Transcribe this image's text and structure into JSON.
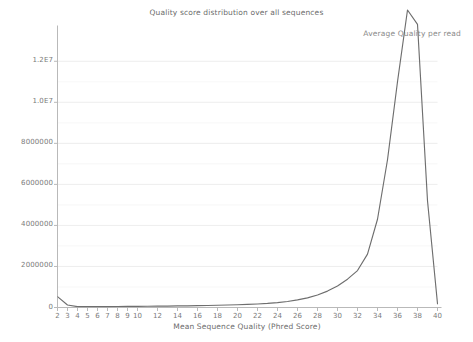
{
  "chart_data": {
    "type": "line",
    "title": "Quality score distribution over all sequences",
    "xlabel": "Mean Sequence Quality (Phred Score)",
    "ylabel": "",
    "legend": [
      "Average Quality per read"
    ],
    "legend_position": "top-right",
    "grid": true,
    "xlim": [
      2,
      40
    ],
    "ylim": [
      0,
      13500000
    ],
    "xticks": [
      2,
      3,
      4,
      5,
      6,
      7,
      8,
      9,
      10,
      12,
      14,
      16,
      18,
      20,
      22,
      24,
      26,
      28,
      30,
      32,
      34,
      36,
      38,
      40
    ],
    "xtick_labels": [
      "2",
      "3",
      "4",
      "5",
      "6",
      "7",
      "8",
      "9",
      "10",
      "12",
      "14",
      "16",
      "18",
      "20",
      "22",
      "24",
      "26",
      "28",
      "30",
      "32",
      "34",
      "36",
      "38",
      "40"
    ],
    "yticks": [
      0,
      2000000,
      4000000,
      6000000,
      8000000,
      10000000,
      12000000
    ],
    "ytick_labels": [
      "0",
      "2000000",
      "4000000",
      "6000000",
      "8000000",
      "1.0E7",
      "1.2E7"
    ],
    "line_color": "#6e6e6e",
    "series": [
      {
        "name": "Average Quality per read",
        "x": [
          2,
          3,
          4,
          5,
          6,
          7,
          8,
          9,
          10,
          11,
          12,
          13,
          14,
          15,
          16,
          17,
          18,
          19,
          20,
          21,
          22,
          23,
          24,
          25,
          26,
          27,
          28,
          29,
          30,
          31,
          32,
          33,
          34,
          35,
          36,
          37,
          38,
          39,
          40
        ],
        "values": [
          530000,
          120000,
          45000,
          40000,
          42000,
          45000,
          48000,
          52000,
          56000,
          60000,
          65000,
          70000,
          76000,
          82000,
          90000,
          98000,
          108000,
          120000,
          135000,
          152000,
          172000,
          200000,
          240000,
          295000,
          370000,
          470000,
          610000,
          800000,
          1050000,
          1380000,
          1800000,
          2600000,
          4300000,
          7200000,
          11000000,
          14500000,
          13800000,
          5200000,
          180000
        ]
      }
    ]
  }
}
